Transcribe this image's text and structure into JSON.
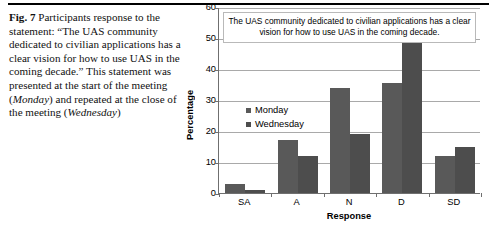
{
  "caption": {
    "fig_label": "Fig. 7",
    "text_before_italic_1": " Participants response to the statement: “The UAS community dedicated to civilian applications has a clear vision for how to use UAS in the coming decade.” This statement was presented at the start of the meeting (",
    "italic_1": "Monday",
    "text_between": ") and repeated at the close of the meeting (",
    "italic_2": "Wednesday",
    "text_after": ")"
  },
  "chart_data": {
    "type": "bar",
    "title": "The UAS community dedicated to civilian applications has a clear vision for how to use UAS in the coming decade.",
    "xlabel": "Response",
    "ylabel": "Percentage",
    "categories": [
      "SA",
      "A",
      "N",
      "D",
      "SD"
    ],
    "series": [
      {
        "name": "Monday",
        "values": [
          3,
          17,
          34,
          35.5,
          12
        ],
        "color": "#595959"
      },
      {
        "name": "Wednesday",
        "values": [
          1,
          12,
          19,
          52,
          15
        ],
        "color": "#4d4d4d"
      }
    ],
    "ylim": [
      0,
      60
    ],
    "yticks": [
      0,
      10,
      20,
      30,
      40,
      50,
      60
    ],
    "grid": true,
    "legend_position": "inside-left"
  }
}
